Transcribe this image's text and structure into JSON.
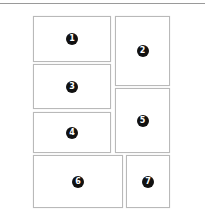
{
  "layout": {
    "panels": [
      {
        "label": "1"
      },
      {
        "label": "2"
      },
      {
        "label": "3"
      },
      {
        "label": "4"
      },
      {
        "label": "5"
      },
      {
        "label": "6"
      },
      {
        "label": "7"
      }
    ]
  }
}
